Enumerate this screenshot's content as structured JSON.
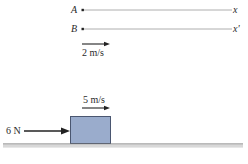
{
  "diagram": {
    "track_a": {
      "point_label": "A",
      "end_label": "x"
    },
    "track_b": {
      "point_label": "B",
      "end_label": "x'"
    },
    "velocity_top": {
      "value": "2 m/s"
    },
    "block": {
      "velocity": "5 m/s",
      "force": "6 N",
      "color": "#9aaccc",
      "border": "#4a5670"
    },
    "ground": {
      "color": "#777777"
    }
  }
}
